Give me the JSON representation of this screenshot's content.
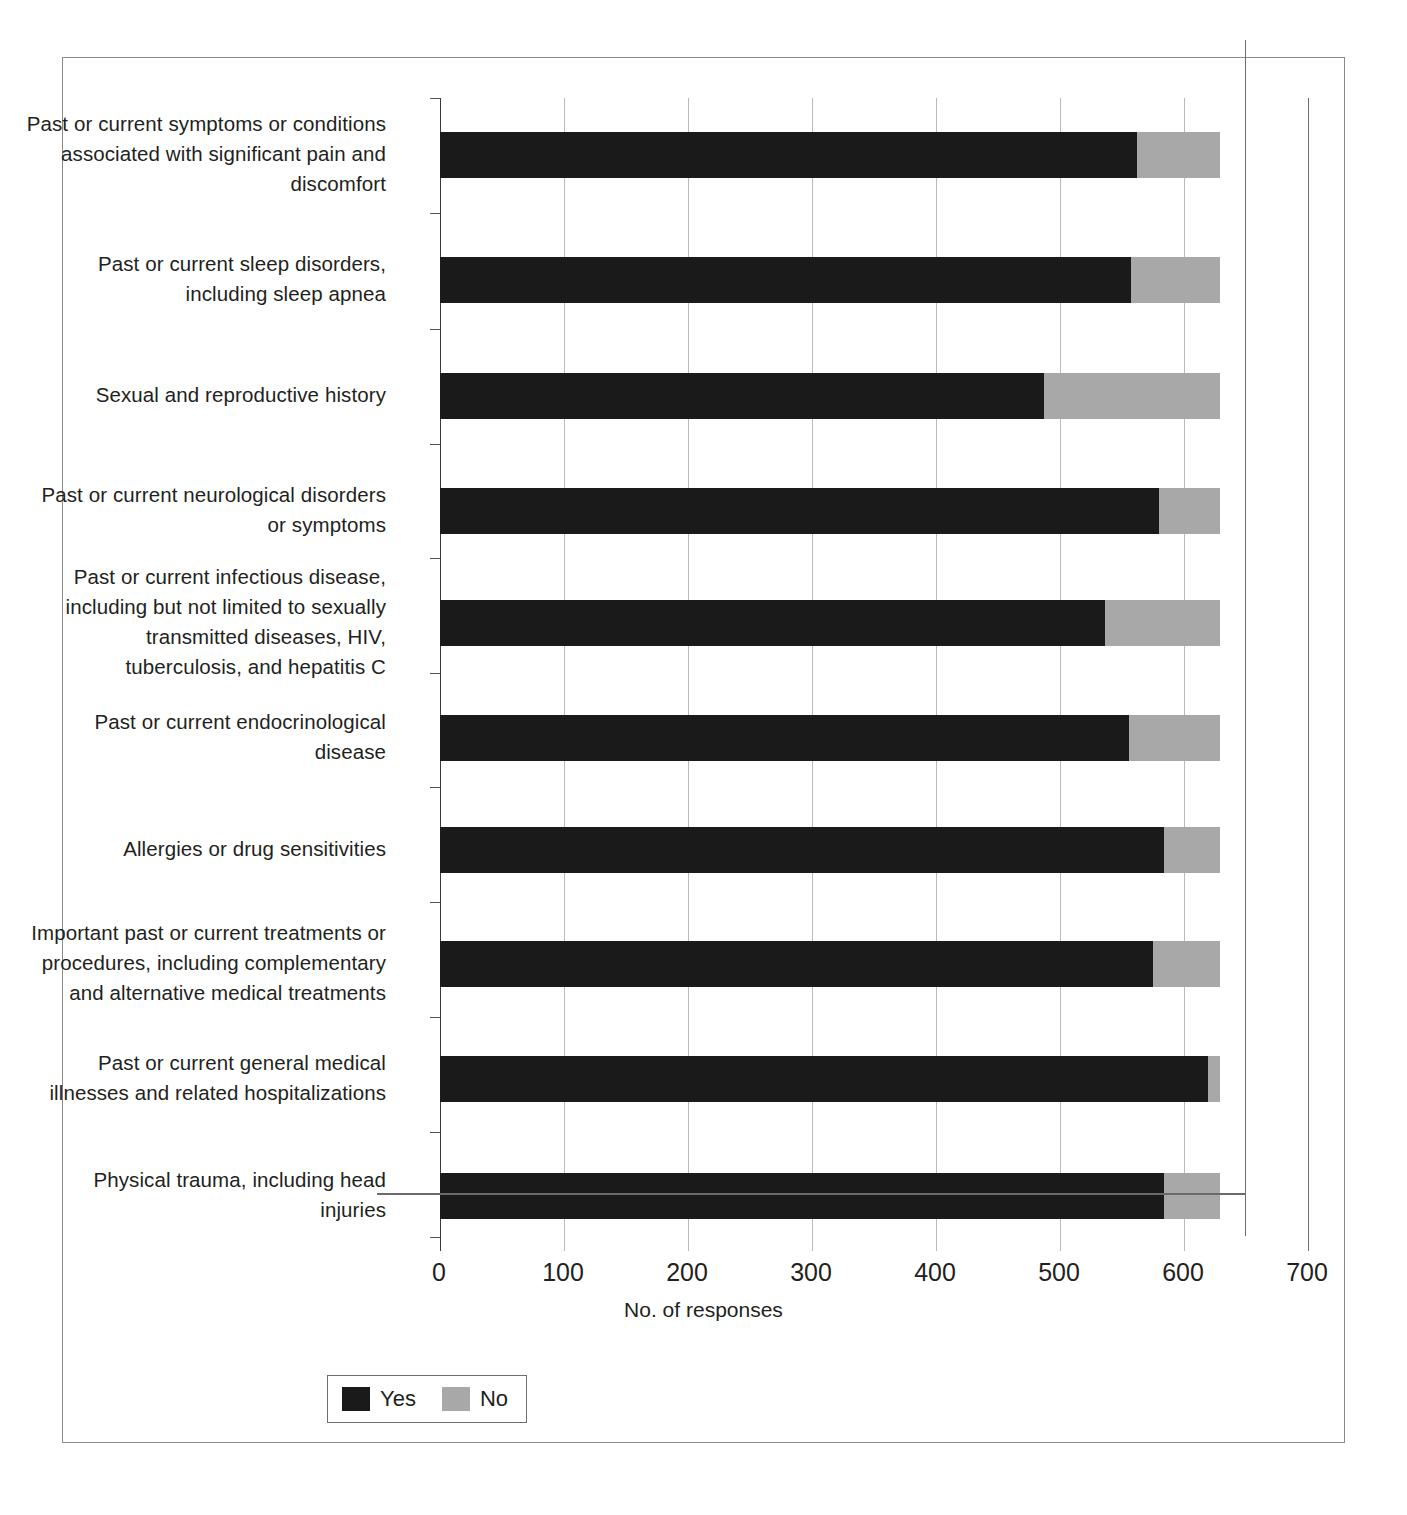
{
  "chart_data": {
    "type": "bar",
    "orientation": "horizontal",
    "stacked": true,
    "title": "",
    "xlabel": "No. of responses",
    "ylabel": "",
    "xlim": [
      0,
      700
    ],
    "xticks": [
      "0",
      "100",
      "200",
      "300",
      "400",
      "500",
      "600",
      "700"
    ],
    "grid": true,
    "legend_position": "bottom-left",
    "legend": [
      {
        "name": "Yes",
        "color": "#1a1a1a"
      },
      {
        "name": "No",
        "color": "#a8a8a8"
      }
    ],
    "categories": [
      "Past or current symptoms or conditions associated with significant pain and discomfort",
      "Past or current sleep disorders, including sleep apnea",
      "Sexual and reproductive history",
      "Past or current neurological disorders or symptoms",
      "Past or current infectious disease, including but not limited to sexually transmitted diseases, HIV, tuberculosis, and hepatitis C",
      "Past or current endocrinological disease",
      "Allergies or drug sensitivities",
      "Important past or current treatments or procedures, including complementary and alternative medical treatments",
      "Past or current general medical illnesses and related hospitalizations",
      "Physical trauma, including head injuries"
    ],
    "series": [
      {
        "name": "Yes",
        "color": "#1a1a1a",
        "values": [
          562,
          557,
          487,
          580,
          536,
          556,
          584,
          575,
          619,
          584
        ]
      },
      {
        "name": "No",
        "color": "#a8a8a8",
        "values": [
          67,
          72,
          142,
          49,
          93,
          73,
          45,
          54,
          10,
          45
        ]
      }
    ],
    "row_totals": [
      629,
      629,
      629,
      629,
      629,
      629,
      629,
      629,
      629,
      629
    ]
  },
  "axis": {
    "x_title": "No. of responses"
  }
}
